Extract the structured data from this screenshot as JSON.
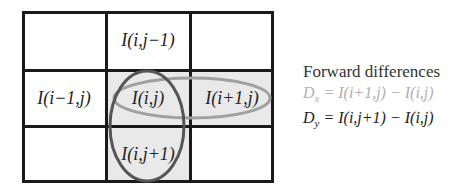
{
  "diagram": {
    "grid": {
      "rows": 3,
      "cols": 3,
      "cells": [
        {
          "row": 0,
          "col": 0,
          "label": "",
          "shaded": false
        },
        {
          "row": 0,
          "col": 1,
          "label": "I(i,j−1)",
          "shaded": false
        },
        {
          "row": 0,
          "col": 2,
          "label": "",
          "shaded": false
        },
        {
          "row": 1,
          "col": 0,
          "label": "I(i−1,j)",
          "shaded": false
        },
        {
          "row": 1,
          "col": 1,
          "label": "I(i,j)",
          "shaded": true
        },
        {
          "row": 1,
          "col": 2,
          "label": "I(i+1,j)",
          "shaded": true
        },
        {
          "row": 2,
          "col": 0,
          "label": "",
          "shaded": false
        },
        {
          "row": 2,
          "col": 1,
          "label": "I(i,j+1)",
          "shaded": true
        },
        {
          "row": 2,
          "col": 2,
          "label": "",
          "shaded": false
        }
      ]
    },
    "ellipses": [
      {
        "name": "horizontal-x-difference",
        "stroke": "#a0a0a0",
        "covers": [
          "I(i,j)",
          "I(i+1,j)"
        ]
      },
      {
        "name": "vertical-y-difference",
        "stroke": "#555555",
        "covers": [
          "I(i,j)",
          "I(i,j+1)"
        ]
      }
    ],
    "legend": {
      "title": "Forward differences",
      "dx": {
        "lhs": "D",
        "sub": "x",
        "rhs": "= I(i+1,j) − I(i,j)",
        "color": "#b0b0b0"
      },
      "dy": {
        "lhs": "D",
        "sub": "y",
        "rhs": "= I(i,j+1) − I(i,j)",
        "color": "#222222"
      }
    },
    "colors": {
      "grid_line": "#1a1a1a",
      "shade": "#e9e9e9",
      "text": "#222222"
    }
  }
}
